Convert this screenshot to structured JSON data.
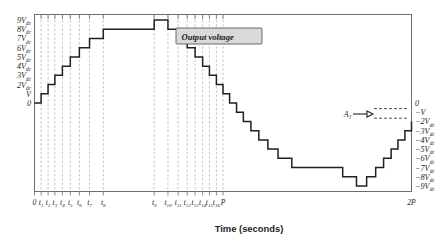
{
  "chart_data": {
    "type": "line",
    "title": "Output voltage",
    "xlabel": "Time (seconds)",
    "ylabel": "",
    "subtype": "staircase-multilevel-inverter-waveform",
    "grid": true,
    "legend_position": "none",
    "xlim": [
      0,
      2
    ],
    "ylim": [
      -9.6,
      9.6
    ],
    "y_axis_left_labels": [
      "9V",
      "8V",
      "7V",
      "6V",
      "5V",
      "4V",
      "3V",
      "2V",
      "V",
      "0"
    ],
    "y_axis_left_subscripts": [
      "dc",
      "dc",
      "dc",
      "dc",
      "dc",
      "dc",
      "dc",
      "dc",
      "",
      ""
    ],
    "y_axis_left_values": [
      9,
      8,
      7,
      6,
      5,
      4,
      3,
      2,
      1,
      0
    ],
    "y_axis_right_labels": [
      "0",
      "−V",
      "−2V",
      "−3V",
      "−4V",
      "−5V",
      "−6V",
      "−7V",
      "−8V",
      "−9V"
    ],
    "y_axis_right_subscripts": [
      "",
      "",
      "dc",
      "dc",
      "dc",
      "dc",
      "dc",
      "dc",
      "dc",
      "dc"
    ],
    "y_axis_right_values": [
      0,
      -1,
      -2,
      -3,
      -4,
      -5,
      -6,
      -7,
      -8,
      -9
    ],
    "x_tick_labels": [
      "0",
      "t",
      "t",
      "t",
      "t",
      "t",
      "t",
      "t",
      "t",
      "t",
      "t",
      "t",
      "t",
      "t",
      "t",
      "t",
      "t",
      "P",
      "2P"
    ],
    "x_tick_subscripts": [
      "",
      "1",
      "2",
      "3",
      "4",
      "5",
      "6",
      "7",
      "8",
      "9",
      "10",
      "11",
      "12",
      "13",
      "14",
      "15",
      "16",
      "",
      ""
    ],
    "x_tick_positions": [
      0.0,
      0.035,
      0.072,
      0.108,
      0.148,
      0.19,
      0.238,
      0.292,
      0.365,
      0.635,
      0.708,
      0.762,
      0.81,
      0.852,
      0.892,
      0.928,
      0.965,
      1.0,
      2.0
    ],
    "annotation_label": "A",
    "annotation_subscript": "J",
    "series": [
      {
        "name": "Output voltage",
        "comment": "19-level staircase: rises 0->9 in unit steps at t1..t8, holds at 9, descends 9->-9, holds at -9, returns to 0 at 2P",
        "step_times": [
          0.0,
          0.035,
          0.072,
          0.108,
          0.148,
          0.19,
          0.238,
          0.292,
          0.365,
          0.635,
          0.708,
          0.762,
          0.81,
          0.852,
          0.892,
          0.928,
          0.965,
          1.0,
          1.035,
          1.072,
          1.108,
          1.148,
          1.19,
          1.238,
          1.292,
          1.365,
          1.635,
          1.708,
          1.762,
          1.81,
          1.852,
          1.892,
          1.928,
          1.965,
          2.0
        ],
        "step_values": [
          0,
          1,
          2,
          3,
          4,
          5,
          6,
          7,
          8,
          9,
          8,
          7,
          6,
          5,
          4,
          3,
          2,
          1,
          0,
          -1,
          -2,
          -3,
          -4,
          -5,
          -6,
          -7,
          -8,
          -9,
          -8,
          -7,
          -6,
          -5,
          -4,
          -3,
          -2
        ]
      }
    ]
  },
  "chart": {
    "callout_label": "Output voltage",
    "x_axis_title": "Time (seconds)",
    "annotation": {
      "base": "A",
      "sub": "J"
    }
  }
}
